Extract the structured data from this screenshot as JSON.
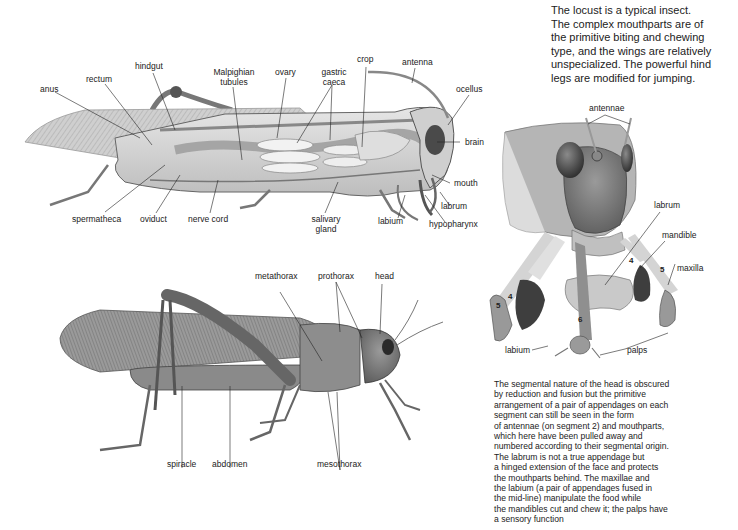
{
  "intro_text": {
    "lines": [
      "The locust is a typical insect.",
      "The complex mouthparts are of",
      "the primitive biting and chewing",
      "type, and the wings are relatively",
      "unspecialized. The powerful hind",
      "legs are modified for jumping."
    ]
  },
  "internal_anatomy": {
    "labels": {
      "anus": "anus",
      "rectum": "rectum",
      "hindgut": "hindgut",
      "malpighian_1": "Malpighian",
      "malpighian_2": "tubules",
      "ovary": "ovary",
      "gastric_1": "gastric",
      "gastric_2": "caeca",
      "crop": "crop",
      "antenna": "antenna",
      "ocellus": "ocellus",
      "brain": "brain",
      "mouth": "mouth",
      "labrum": "labrum",
      "hypopharynx": "hypopharynx",
      "labium": "labium",
      "salivary_1": "salivary",
      "salivary_2": "gland",
      "nerve_cord": "nerve cord",
      "oviduct": "oviduct",
      "spermatheca": "spermatheca"
    }
  },
  "external_anatomy": {
    "labels": {
      "metathorax": "metathorax",
      "prothorax": "prothorax",
      "head": "head",
      "spiracle": "spiracle",
      "abdomen": "abdomen",
      "mesothorax": "mesothorax"
    }
  },
  "head_mouthparts": {
    "labels": {
      "antennae": "antennae",
      "labrum": "labrum",
      "mandible": "mandible",
      "maxilla": "maxilla",
      "labium": "labium",
      "palps": "palps"
    },
    "segment_numbers": [
      "4",
      "5",
      "4",
      "5",
      "6"
    ]
  },
  "segment_text": {
    "lines": [
      "The segmental nature of the head is obscured",
      "by reduction and fusion but the primitive",
      "arrangement of a pair of appendages on each",
      "segment can still be seen in the form",
      "of antennae (on segment 2) and mouthparts,",
      "which here have been pulled away and",
      "numbered according to their segmental origin.",
      "The labrum is not a true appendage but",
      "a hinged extension of the face and protects",
      "the mouthparts behind. The maxillae and",
      "the labium (a pair of appendages fused in",
      "the mid-line) manipulate the food while",
      "the mandibles cut and chew it; the palps have",
      "a sensory function"
    ]
  }
}
